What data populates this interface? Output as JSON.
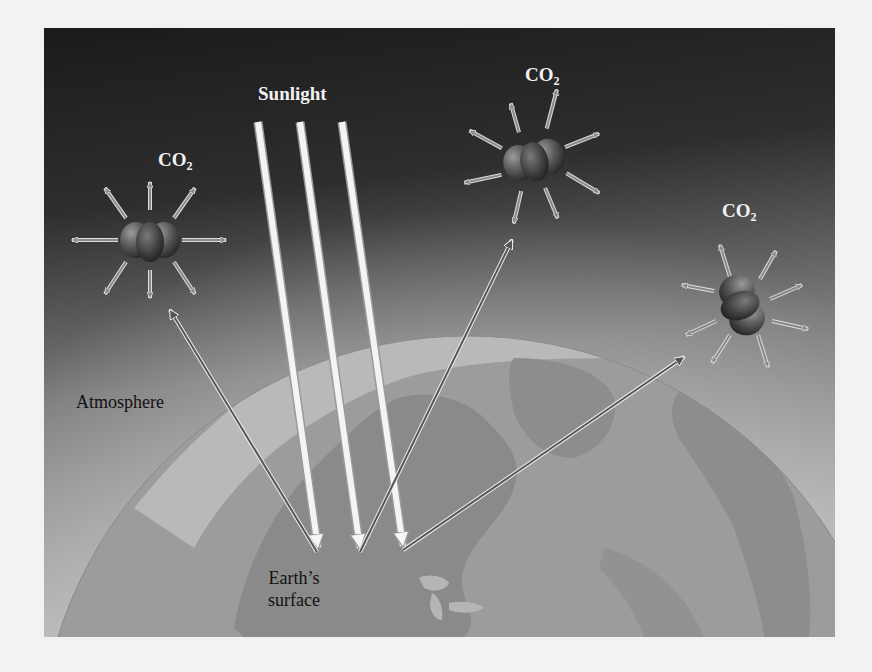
{
  "figure": {
    "labels": {
      "sunlight": "Sunlight",
      "atmosphere": "Atmosphere",
      "earth_surface_line1": "Earth’s",
      "earth_surface_line2": "surface"
    },
    "molecules": [
      {
        "label_main": "CO",
        "label_sub": "2"
      },
      {
        "label_main": "CO",
        "label_sub": "2"
      },
      {
        "label_main": "CO",
        "label_sub": "2"
      }
    ],
    "colors": {
      "sky_top": "#1c1c1c",
      "sky_bottom": "#b4b4b4",
      "globe": "#9e9e9e",
      "land": "#8a8a8a",
      "ice": "#bdbdbd",
      "beam": "#f4f4f4",
      "ir_arrow": "#555555",
      "page_bg": "#f2f2f2"
    }
  }
}
